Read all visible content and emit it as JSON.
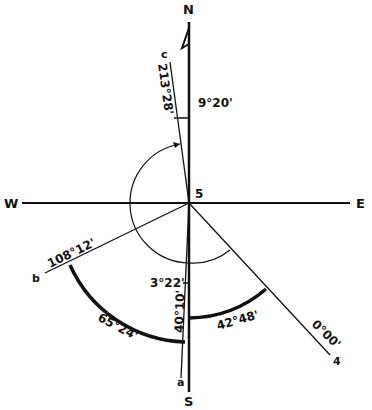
{
  "diagram": {
    "station": "5",
    "compass": {
      "north": "N",
      "south": "S",
      "west": "W",
      "east": "E"
    },
    "lines": [
      {
        "id": "4",
        "bearing_label": "0°00'"
      },
      {
        "id": "a",
        "bearing_label": ""
      },
      {
        "id": "b",
        "bearing_label": "108°12'"
      },
      {
        "id": "c",
        "bearing_label": "213°28'"
      }
    ],
    "angles": {
      "a_to_c_offset": "9°20'",
      "small_angle": "3°22'",
      "angle_4_to_south": "42°48'",
      "angle_a_to_south": "40°10'",
      "angle_b_to_a": "65°24'"
    },
    "colors": {
      "ink": "#111111",
      "background": "#ffffff"
    }
  }
}
